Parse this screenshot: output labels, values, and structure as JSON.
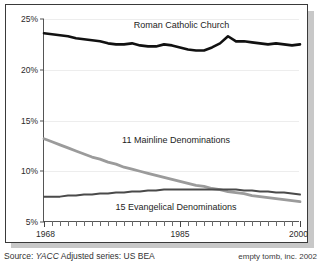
{
  "chart_data": {
    "type": "line",
    "title": "",
    "xlabel": "",
    "ylabel": "",
    "xlim": [
      1968,
      2000
    ],
    "ylim": [
      5,
      25
    ],
    "ytick_labels": [
      "25%",
      "20%",
      "15%",
      "10%",
      "5%"
    ],
    "ytick_values": [
      25,
      20,
      15,
      10,
      5
    ],
    "xtick_labels": [
      "1968",
      "1985",
      "2000"
    ],
    "xtick_values": [
      1968,
      1985,
      2000
    ],
    "grid": true,
    "legend": "inline-annotations",
    "x": [
      1968,
      1969,
      1970,
      1971,
      1972,
      1973,
      1974,
      1975,
      1976,
      1977,
      1978,
      1979,
      1980,
      1981,
      1982,
      1983,
      1984,
      1985,
      1986,
      1987,
      1988,
      1989,
      1990,
      1991,
      1992,
      1993,
      1994,
      1995,
      1996,
      1997,
      1998,
      1999,
      2000
    ],
    "series": [
      {
        "name": "Roman Catholic Church",
        "color": "#111111",
        "width": 2.6,
        "values": [
          23.6,
          23.5,
          23.4,
          23.3,
          23.1,
          23.0,
          22.9,
          22.8,
          22.6,
          22.5,
          22.5,
          22.6,
          22.4,
          22.3,
          22.3,
          22.5,
          22.4,
          22.2,
          22.0,
          21.9,
          21.9,
          22.2,
          22.6,
          23.3,
          22.8,
          22.8,
          22.7,
          22.6,
          22.5,
          22.6,
          22.5,
          22.4,
          22.5
        ],
        "label_x": 1985.2,
        "label_y": 24.3
      },
      {
        "name": "11 Mainline Denominations",
        "color": "#9b9b9b",
        "width": 2.8,
        "values": [
          13.2,
          12.9,
          12.6,
          12.3,
          12.0,
          11.7,
          11.4,
          11.2,
          10.9,
          10.7,
          10.4,
          10.2,
          10.0,
          9.8,
          9.6,
          9.4,
          9.2,
          9.0,
          8.8,
          8.6,
          8.5,
          8.3,
          8.2,
          8.0,
          7.9,
          7.8,
          7.6,
          7.5,
          7.4,
          7.3,
          7.2,
          7.1,
          7.0
        ],
        "label_x": 1984.5,
        "label_y": 13.0
      },
      {
        "name": "15 Evangelical Denominations",
        "color": "#4a4a4a",
        "width": 2.0,
        "values": [
          7.5,
          7.5,
          7.5,
          7.6,
          7.6,
          7.7,
          7.7,
          7.8,
          7.8,
          7.9,
          7.9,
          8.0,
          8.0,
          8.1,
          8.1,
          8.2,
          8.2,
          8.2,
          8.2,
          8.2,
          8.2,
          8.2,
          8.2,
          8.2,
          8.2,
          8.1,
          8.1,
          8.0,
          8.0,
          7.9,
          7.9,
          7.8,
          7.7
        ],
        "label_x": 1984.5,
        "label_y": 6.4
      }
    ]
  },
  "footer": {
    "source_prefix": "Source:",
    "source_italic": "YACC",
    "source_suffix": "Adjusted series: US BEA",
    "credit": "empty tomb, inc. 2002"
  },
  "colors": {
    "frame_border": "#3a3a3a",
    "axis": "#555555",
    "grid": "#ededed",
    "background": "#ffffff",
    "shadow": "#c8c8c8"
  }
}
